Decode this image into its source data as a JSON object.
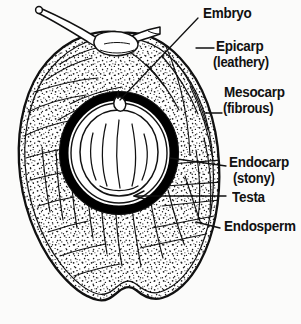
{
  "diagram": {
    "background_color": "#fbfbfa",
    "ink_color": "#111111"
  },
  "labels": [
    {
      "id": "embryo",
      "text": "Embryo",
      "sub": "",
      "x": 203,
      "y": 7,
      "leader": "diagonal-long"
    },
    {
      "id": "epicarp",
      "text": "Epicarp",
      "sub": "(leathery)",
      "x": 216,
      "y": 40,
      "leader": "short-dash"
    },
    {
      "id": "mesocarp",
      "text": "Mesocarp",
      "sub": "(fibrous)",
      "x": 224,
      "y": 86,
      "leader": "short-dash"
    },
    {
      "id": "endocarp",
      "text": "Endocarp",
      "sub": "(stony)",
      "x": 228,
      "y": 156,
      "leader": "long-line"
    },
    {
      "id": "testa",
      "text": "Testa",
      "sub": "",
      "x": 228,
      "y": 192,
      "leader": "arrow-line"
    },
    {
      "id": "endosperm",
      "text": "Endosperm",
      "sub": "",
      "x": 222,
      "y": 219,
      "leader": "long-line"
    }
  ],
  "parts": [
    {
      "name": "stalk",
      "description": "two slender stalk projections at apex"
    },
    {
      "name": "epicarp",
      "description": "outer leathery double-line skin"
    },
    {
      "name": "mesocarp",
      "description": "thick stippled fibrous husk"
    },
    {
      "name": "endocarp",
      "description": "thick black stony shell ring"
    },
    {
      "name": "testa",
      "description": "thin inner seed coat line"
    },
    {
      "name": "endosperm",
      "description": "pale kernel with vertical striations"
    },
    {
      "name": "embryo",
      "description": "small loop at top of the seed"
    }
  ],
  "colors": {
    "ink": "#111111",
    "shell": "#000000",
    "flesh": "#ffffff",
    "paper": "#fbfbfa"
  }
}
